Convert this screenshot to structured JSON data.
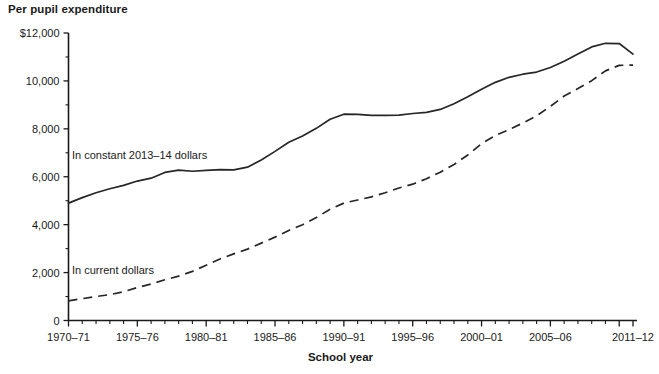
{
  "chart_data": {
    "type": "line",
    "title": "Per pupil expenditure",
    "xlabel": "School year",
    "ylabel": "",
    "ylim": [
      0,
      12000
    ],
    "yticks": [
      0,
      2000,
      4000,
      6000,
      8000,
      10000,
      12000
    ],
    "ytick_labels": [
      "0",
      "2,000",
      "4,000",
      "6,000",
      "8,000",
      "10,000",
      "$12,000"
    ],
    "xlim": [
      "1970-71",
      "2011-12"
    ],
    "xtick_labels": [
      "1970–71",
      "1975–76",
      "1980–81",
      "1985–86",
      "1990–91",
      "1995–96",
      "2000–01",
      "2005–06",
      "2011–12"
    ],
    "grid": false,
    "legend_position": "inline-annotations",
    "x": [
      "1970-71",
      "1971-72",
      "1972-73",
      "1973-74",
      "1974-75",
      "1975-76",
      "1976-77",
      "1977-78",
      "1978-79",
      "1979-80",
      "1980-81",
      "1981-82",
      "1982-83",
      "1983-84",
      "1984-85",
      "1985-86",
      "1986-87",
      "1987-88",
      "1988-89",
      "1989-90",
      "1990-91",
      "1991-92",
      "1992-93",
      "1993-94",
      "1994-95",
      "1995-96",
      "1996-97",
      "1997-98",
      "1998-99",
      "1999-00",
      "2000-01",
      "2001-02",
      "2002-03",
      "2003-04",
      "2004-05",
      "2005-06",
      "2006-07",
      "2007-08",
      "2008-09",
      "2009-10",
      "2010-11",
      "2011-12"
    ],
    "series": [
      {
        "name": "In constant 2013–14 dollars",
        "style": "solid",
        "color": "#262626",
        "values": [
          4900,
          5130,
          5330,
          5500,
          5640,
          5820,
          5940,
          6180,
          6280,
          6230,
          6270,
          6300,
          6290,
          6400,
          6700,
          7060,
          7440,
          7700,
          8020,
          8400,
          8610,
          8600,
          8560,
          8560,
          8570,
          8640,
          8690,
          8810,
          9050,
          9340,
          9650,
          9940,
          10150,
          10280,
          10370,
          10560,
          10820,
          11120,
          11420,
          11570,
          11560,
          11120
        ]
      },
      {
        "name": "In current dollars",
        "style": "dashed",
        "color": "#262626",
        "values": [
          820,
          910,
          1000,
          1080,
          1200,
          1380,
          1520,
          1700,
          1850,
          2050,
          2310,
          2570,
          2780,
          2980,
          3230,
          3480,
          3760,
          4000,
          4300,
          4640,
          4900,
          5030,
          5160,
          5330,
          5530,
          5690,
          5920,
          6190,
          6510,
          6910,
          7380,
          7720,
          7970,
          8240,
          8540,
          8940,
          9370,
          9680,
          10010,
          10420,
          10650,
          10660
        ]
      }
    ],
    "annotations": [
      {
        "text": "In constant 2013–14 dollars",
        "x_px": 72,
        "y_px": 159
      },
      {
        "text": "In current dollars",
        "x_px": 72,
        "y_px": 274
      }
    ]
  }
}
